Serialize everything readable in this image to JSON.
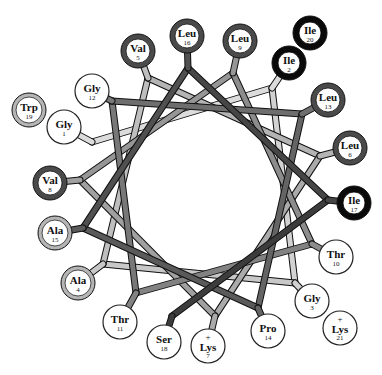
{
  "diagram": {
    "type": "helical-wheel",
    "center": [
      200,
      190
    ],
    "line_colors": {
      "early": "#d8d8d8",
      "mid": "#8a8a8a",
      "late": "#1a1a1a"
    },
    "ring_styles": {
      "white": {
        "fill": "#ffffff",
        "stroke": "#222222",
        "width": 1
      },
      "light": {
        "fill": "#ffffff",
        "stroke": "#b5b5b5",
        "width": 4,
        "inner": "#222222"
      },
      "dark": {
        "fill": "#ffffff",
        "stroke": "#4a4a4a",
        "width": 5,
        "inner": "#111111"
      },
      "black": {
        "fill": "#ffffff",
        "stroke": "#0a0a0a",
        "width": 6,
        "inner": "#000000"
      }
    },
    "residues": [
      {
        "num": "1",
        "name": "Gly",
        "charge": "",
        "style": "white",
        "cx": 64,
        "cy": 127,
        "vx": 92,
        "vy": 142
      },
      {
        "num": "2",
        "name": "Ile",
        "charge": "",
        "style": "black",
        "cx": 289,
        "cy": 63,
        "vx": 272,
        "vy": 88
      },
      {
        "num": "3",
        "name": "Gly",
        "charge": "",
        "style": "white",
        "cx": 312,
        "cy": 301,
        "vx": 295,
        "vy": 283
      },
      {
        "num": "4",
        "name": "Ala",
        "charge": "",
        "style": "light",
        "cx": 78,
        "cy": 283,
        "vx": 103,
        "vy": 264
      },
      {
        "num": "5",
        "name": "Val",
        "charge": "",
        "style": "dark",
        "cx": 138,
        "cy": 51,
        "vx": 148,
        "vy": 78
      },
      {
        "num": "6",
        "name": "Leu",
        "charge": "",
        "style": "dark",
        "cx": 350,
        "cy": 148,
        "vx": 320,
        "vy": 156
      },
      {
        "num": "7",
        "name": "Lys",
        "charge": "+",
        "style": "white",
        "cx": 208,
        "cy": 346,
        "vx": 215,
        "vy": 316
      },
      {
        "num": "8",
        "name": "Val",
        "charge": "",
        "style": "dark",
        "cx": 50,
        "cy": 183,
        "vx": 80,
        "vy": 180
      },
      {
        "num": "9",
        "name": "Leu",
        "charge": "",
        "style": "dark",
        "cx": 240,
        "cy": 41,
        "vx": 233,
        "vy": 73
      },
      {
        "num": "10",
        "name": "Thr",
        "charge": "",
        "style": "white",
        "cx": 336,
        "cy": 257,
        "vx": 312,
        "vy": 244
      },
      {
        "num": "11",
        "name": "Thr",
        "charge": "",
        "style": "white",
        "cx": 120,
        "cy": 322,
        "vx": 136,
        "vy": 293
      },
      {
        "num": "12",
        "name": "Gly",
        "charge": "",
        "style": "white",
        "cx": 92,
        "cy": 91,
        "vx": 112,
        "vy": 101
      },
      {
        "num": "13",
        "name": "Leu",
        "charge": "",
        "style": "dark",
        "cx": 328,
        "cy": 100,
        "vx": 302,
        "vy": 114
      },
      {
        "num": "14",
        "name": "Pro",
        "charge": "",
        "style": "white",
        "cx": 268,
        "cy": 331,
        "vx": 258,
        "vy": 308
      },
      {
        "num": "15",
        "name": "Ala",
        "charge": "",
        "style": "light",
        "cx": 55,
        "cy": 233,
        "vx": 83,
        "vy": 228
      },
      {
        "num": "16",
        "name": "Leu",
        "charge": "",
        "style": "dark",
        "cx": 187,
        "cy": 36,
        "vx": 188,
        "vy": 68
      },
      {
        "num": "17",
        "name": "Ile",
        "charge": "",
        "style": "black",
        "cx": 354,
        "cy": 203,
        "vx": 328,
        "vy": 200
      },
      {
        "num": "18",
        "name": "Ser",
        "charge": "",
        "style": "white",
        "cx": 164,
        "cy": 342,
        "vx": 172,
        "vy": 316
      },
      {
        "num": "19",
        "name": "Trp",
        "charge": "",
        "style": "light",
        "cx": 29,
        "cy": 110,
        "vx": 29,
        "vy": 110
      },
      {
        "num": "20",
        "name": "Ile",
        "charge": "",
        "style": "black",
        "cx": 310,
        "cy": 33,
        "vx": 310,
        "vy": 33
      },
      {
        "num": "21",
        "name": "Lys",
        "charge": "+",
        "style": "white",
        "cx": 340,
        "cy": 328,
        "vx": 340,
        "vy": 328
      }
    ]
  }
}
